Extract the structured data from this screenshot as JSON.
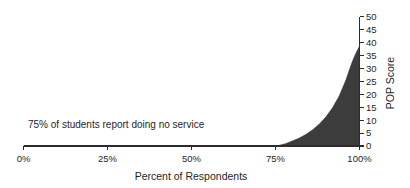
{
  "chart_data": {
    "type": "area",
    "title": "",
    "xlabel": "Percent of Respondents",
    "ylabel": "POP Score",
    "xlim": [
      0,
      100
    ],
    "ylim": [
      0,
      50
    ],
    "grid": false,
    "legend": null,
    "x_tick_labels": [
      "0%",
      "25%",
      "50%",
      "75%",
      "100%"
    ],
    "x_tick_values": [
      0,
      25,
      50,
      75,
      100
    ],
    "y_tick_labels": [
      "0",
      "5",
      "10",
      "15",
      "20",
      "25",
      "30",
      "35",
      "40",
      "45",
      "50"
    ],
    "y_tick_values": [
      0,
      5,
      10,
      15,
      20,
      25,
      30,
      35,
      40,
      45,
      50
    ],
    "y_axis_position": "right",
    "series": [
      {
        "name": "POP Score distribution",
        "fill_color": "#3c3c3c",
        "x": [
          0,
          5,
          10,
          15,
          20,
          25,
          30,
          35,
          40,
          45,
          50,
          55,
          60,
          65,
          70,
          74,
          76,
          78,
          80,
          82,
          84,
          86,
          88,
          90,
          92,
          94,
          96,
          97,
          98,
          99,
          100
        ],
        "values": [
          0,
          0,
          0,
          0,
          0,
          0,
          0,
          0,
          0,
          0,
          0,
          0,
          0,
          0,
          0,
          0,
          0.2,
          0.9,
          1.9,
          3.0,
          4.4,
          6.2,
          8.4,
          11.2,
          14.8,
          19.4,
          25.6,
          29.4,
          33.0,
          36.0,
          38.5
        ]
      }
    ],
    "annotations": [
      {
        "name": "no-service-annotation",
        "text": "75% of students report doing no service",
        "x_pct": 0,
        "y_value": 8
      }
    ]
  },
  "axes": {
    "x_title": "Percent of Respondents",
    "y_title": "POP Score"
  },
  "ticks": {
    "x": [
      "0%",
      "25%",
      "50%",
      "75%",
      "100%"
    ],
    "y": [
      "0",
      "5",
      "10",
      "15",
      "20",
      "25",
      "30",
      "35",
      "40",
      "45",
      "50"
    ]
  },
  "annotation": {
    "text": "75% of students report doing no service"
  }
}
